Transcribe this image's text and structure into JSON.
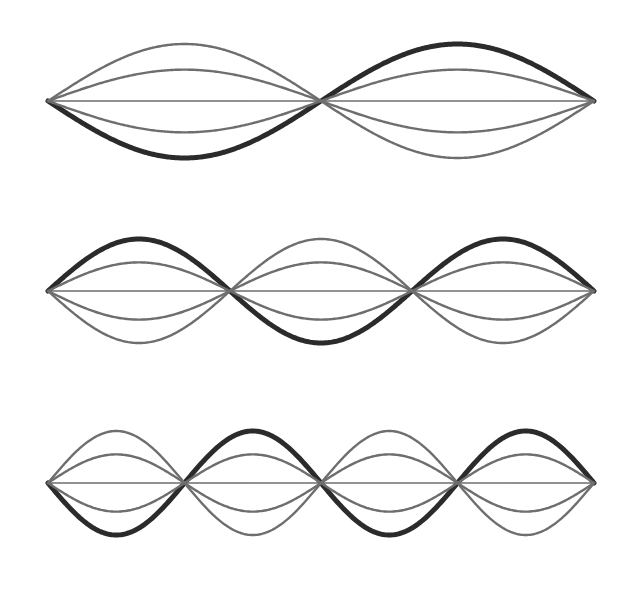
{
  "figure": {
    "background_color": "#ffffff",
    "width": 641,
    "height": 589
  },
  "chart_data": {
    "type": "line",
    "subtitle": "",
    "xlabel": "",
    "ylabel": "",
    "xlim": [
      0,
      1
    ],
    "ylim": [
      -1,
      1
    ],
    "grid": false,
    "legend_position": "none",
    "x_domain_label": "position along string (0 = fixed end, 1 = fixed end)",
    "y_domain_label": "transverse displacement (normalized)",
    "snapshot_amplitudes": [
      1.0,
      0.55,
      0.0,
      -0.55,
      -1.0
    ],
    "snapshot_styles": [
      {
        "name": "maximum-positive-displacement",
        "amplitude": 1.0,
        "color": "#2b2b2b",
        "width": 5.0
      },
      {
        "name": "intermediate-positive-displacement",
        "amplitude": 0.55,
        "color": "#6e6e6e",
        "width": 2.4
      },
      {
        "name": "equilibrium-axis",
        "amplitude": 0.0,
        "color": "#6e6e6e",
        "width": 1.6
      },
      {
        "name": "intermediate-negative-displacement",
        "amplitude": -0.55,
        "color": "#6e6e6e",
        "width": 2.4
      },
      {
        "name": "maximum-negative-displacement",
        "amplitude": -1.0,
        "color": "#6e6e6e",
        "width": 2.4
      }
    ],
    "panels": [
      {
        "id": "panel-1",
        "label": "Second harmonic",
        "harmonic_number": 2,
        "antinodes": 2,
        "nodes": 3,
        "bold_curve_sign": -1,
        "bold_curve_color": "#2b2b2b",
        "geometry": {
          "x_start": 48,
          "x_end": 594,
          "y_axis": 101,
          "amplitude_px": 57
        },
        "node_positions_px": [
          48,
          321,
          594
        ],
        "antinode_positions_px": [
          184,
          457
        ],
        "series": [
          {
            "name": "t = T/4 (max displacement)",
            "amplitude": -1.0,
            "color": "#2b2b2b",
            "width": 5.0
          },
          {
            "name": "t = T/8",
            "amplitude": -0.55,
            "color": "#6e6e6e",
            "width": 2.4
          },
          {
            "name": "t = 0 (equilibrium)",
            "amplitude": 0.0,
            "color": "#6e6e6e",
            "width": 1.6
          },
          {
            "name": "t = 5T/8",
            "amplitude": 0.55,
            "color": "#6e6e6e",
            "width": 2.4
          },
          {
            "name": "t = 3T/4 (max displacement)",
            "amplitude": 1.0,
            "color": "#6e6e6e",
            "width": 2.4
          }
        ]
      },
      {
        "id": "panel-2",
        "label": "Third harmonic",
        "harmonic_number": 3,
        "antinodes": 3,
        "nodes": 4,
        "bold_curve_sign": 1,
        "bold_curve_color": "#2b2b2b",
        "geometry": {
          "x_start": 48,
          "x_end": 594,
          "y_axis": 291,
          "amplitude_px": 52
        },
        "node_positions_px": [
          48,
          230,
          412,
          594
        ],
        "antinode_positions_px": [
          139,
          321,
          503
        ],
        "series": [
          {
            "name": "t = T/4 (max displacement)",
            "amplitude": 1.0,
            "color": "#2b2b2b",
            "width": 5.0
          },
          {
            "name": "t = T/8",
            "amplitude": 0.55,
            "color": "#6e6e6e",
            "width": 2.4
          },
          {
            "name": "t = 0 (equilibrium)",
            "amplitude": 0.0,
            "color": "#6e6e6e",
            "width": 1.6
          },
          {
            "name": "t = 5T/8",
            "amplitude": -0.55,
            "color": "#6e6e6e",
            "width": 2.4
          },
          {
            "name": "t = 3T/4 (max displacement)",
            "amplitude": -1.0,
            "color": "#6e6e6e",
            "width": 2.4
          }
        ]
      },
      {
        "id": "panel-3",
        "label": "Fourth harmonic",
        "harmonic_number": 4,
        "antinodes": 4,
        "nodes": 5,
        "bold_curve_sign": -1,
        "bold_curve_color": "#2b2b2b",
        "geometry": {
          "x_start": 48,
          "x_end": 594,
          "y_axis": 483,
          "amplitude_px": 52
        },
        "node_positions_px": [
          48,
          185,
          321,
          458,
          594
        ],
        "antinode_positions_px": [
          116,
          253,
          389,
          526
        ],
        "series": [
          {
            "name": "t = T/4 (max displacement)",
            "amplitude": -1.0,
            "color": "#2b2b2b",
            "width": 5.0
          },
          {
            "name": "t = T/8",
            "amplitude": -0.55,
            "color": "#6e6e6e",
            "width": 2.4
          },
          {
            "name": "t = 0 (equilibrium)",
            "amplitude": 0.0,
            "color": "#6e6e6e",
            "width": 1.6
          },
          {
            "name": "t = 5T/8",
            "amplitude": 0.55,
            "color": "#6e6e6e",
            "width": 2.4
          },
          {
            "name": "t = 3T/4 (max displacement)",
            "amplitude": 1.0,
            "color": "#6e6e6e",
            "width": 2.4
          }
        ]
      }
    ]
  }
}
